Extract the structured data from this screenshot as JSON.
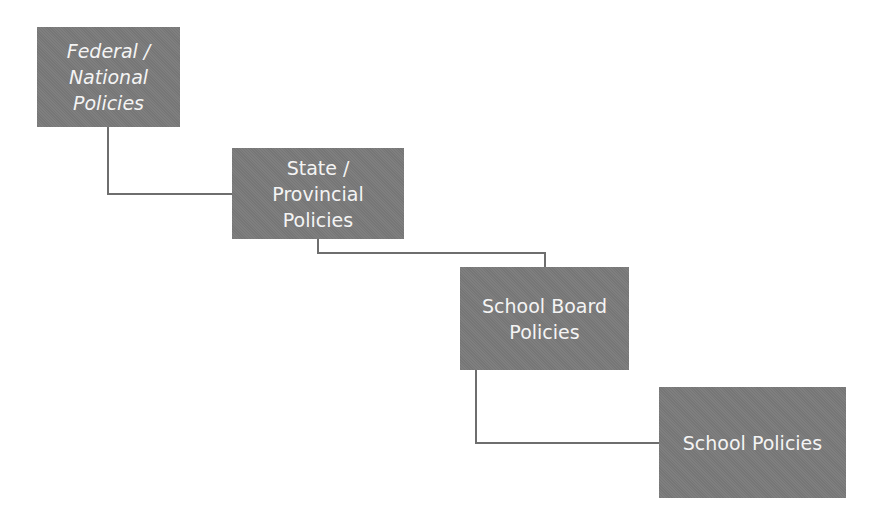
{
  "diagram": {
    "type": "hierarchy",
    "nodes": [
      {
        "id": "federal",
        "label": "Federal /\nNational\nPolicies",
        "italic": true
      },
      {
        "id": "state",
        "label": "State /\nProvincial\nPolicies",
        "italic": false
      },
      {
        "id": "board",
        "label": "School Board\nPolicies",
        "italic": false
      },
      {
        "id": "school",
        "label": "School Policies",
        "italic": false
      }
    ],
    "edges": [
      {
        "from": "federal",
        "to": "state"
      },
      {
        "from": "state",
        "to": "board"
      },
      {
        "from": "board",
        "to": "school"
      }
    ],
    "colors": {
      "box_fill": "#7a7a7a",
      "text": "#f4f4f4",
      "connector": "#6e6e6e",
      "background": "#ffffff"
    }
  }
}
